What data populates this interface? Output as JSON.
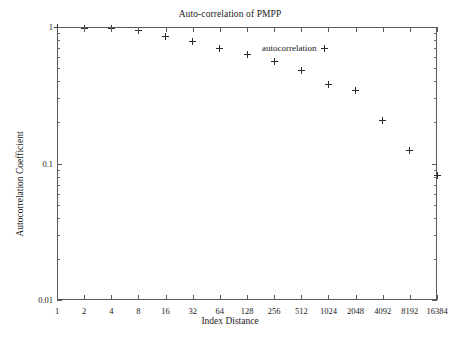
{
  "chart_data": {
    "type": "scatter",
    "title": "Auto-correlation of PMPP",
    "xlabel": "Index Distance",
    "ylabel": "Autocorrelation Coefficient",
    "xscale": "log2",
    "yscale": "log10",
    "xlim": [
      1,
      16384
    ],
    "ylim": [
      0.01,
      1
    ],
    "grid": false,
    "legend_position": "top-right",
    "xticks": [
      1,
      2,
      4,
      8,
      16,
      32,
      64,
      128,
      256,
      512,
      1024,
      2048,
      4096,
      8192,
      16384
    ],
    "xtick_labels": [
      "1",
      "2",
      "4",
      "8",
      "16",
      "32",
      "64",
      "128",
      "256",
      "512",
      "1024",
      "2048",
      "4092",
      "8192",
      "16384"
    ],
    "yticks": [
      0.01,
      0.1,
      1
    ],
    "ytick_labels": [
      "0.01",
      "0.1",
      "1"
    ],
    "series": [
      {
        "name": "autocorrelation",
        "marker": "plus",
        "color": "#2b2b2b",
        "x": [
          1,
          2,
          4,
          8,
          16,
          32,
          64,
          128,
          256,
          512,
          1024,
          2048,
          4096,
          8192,
          16384
        ],
        "values": [
          0.99,
          0.98,
          0.97,
          0.94,
          0.85,
          0.78,
          0.7,
          0.63,
          0.56,
          0.48,
          0.38,
          0.34,
          0.205,
          0.125,
          0.082
        ]
      }
    ]
  },
  "legend": {
    "label": "autocorrelation"
  }
}
